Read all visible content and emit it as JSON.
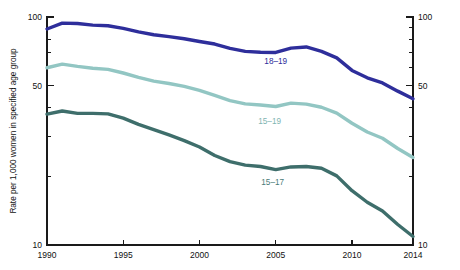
{
  "chart_data": {
    "type": "line",
    "title": "",
    "subtitle": "",
    "xlabel": "",
    "ylabel": "Rate per 1,000 women in specified age group",
    "yscale": "log",
    "ylim": [
      10,
      100
    ],
    "xlim": [
      1990,
      2014
    ],
    "grid": false,
    "legend_position": "inline-labels",
    "x_tick_labels": [
      "1990",
      "1995",
      "2000",
      "2005",
      "2010",
      "2014"
    ],
    "x_ticks": [
      1990,
      1995,
      2000,
      2005,
      2010,
      2014
    ],
    "y_tick_labels": [
      "100",
      "50",
      "10"
    ],
    "y_ticks_major": [
      100,
      50,
      10
    ],
    "y_ticks_minor": [
      90,
      80,
      70,
      60,
      40,
      30,
      20
    ],
    "y_tick_labels_right": [
      "100",
      "50",
      "10"
    ],
    "x": [
      1990,
      1991,
      1992,
      1993,
      1994,
      1995,
      1996,
      1997,
      1998,
      1999,
      2000,
      2001,
      2002,
      2003,
      2004,
      2005,
      2006,
      2007,
      2008,
      2009,
      2010,
      2011,
      2012,
      2013,
      2014
    ],
    "series": [
      {
        "name": "18-19",
        "label": "18–19",
        "color": "#2e2e9b",
        "label_color": "#2e2e9b",
        "label_x": 2005.0,
        "label_y": 62.0,
        "values": [
          88.6,
          94.0,
          93.6,
          92.1,
          91.5,
          89.1,
          86.0,
          83.6,
          82.0,
          80.3,
          78.1,
          76.1,
          72.8,
          70.7,
          70.0,
          69.9,
          73.0,
          73.9,
          70.7,
          66.2,
          58.3,
          54.1,
          51.4,
          47.3,
          43.8
        ]
      },
      {
        "name": "15-19",
        "label": "15–19",
        "color": "#92c6c3",
        "label_color": "#7fb5b2",
        "label_x": 2004.6,
        "label_y": 34.0,
        "values": [
          59.9,
          62.1,
          60.7,
          59.6,
          58.9,
          56.8,
          54.4,
          52.3,
          51.1,
          49.6,
          47.7,
          45.3,
          43.0,
          41.6,
          41.1,
          40.5,
          41.9,
          41.5,
          40.2,
          37.9,
          34.2,
          31.3,
          29.4,
          26.5,
          24.2
        ]
      },
      {
        "name": "15-17",
        "label": "15–17",
        "color": "#3e6e6b",
        "label_color": "#4a7b78",
        "label_x": 2004.8,
        "label_y": 18.4,
        "values": [
          37.5,
          38.7,
          37.8,
          37.8,
          37.6,
          36.0,
          33.8,
          32.1,
          30.4,
          28.7,
          26.9,
          24.7,
          23.2,
          22.4,
          22.1,
          21.4,
          22.0,
          22.1,
          21.7,
          20.1,
          17.3,
          15.4,
          14.1,
          12.3,
          10.9
        ]
      }
    ]
  },
  "axis": {
    "y_title": "Rate per 1,000 women in specified age group"
  }
}
